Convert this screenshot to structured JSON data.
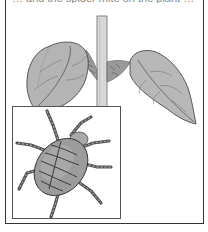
{
  "figure": {
    "caption_cropped": "… and the spider mite on the plant …",
    "colors": {
      "frame": "#333333",
      "leaf_fill": "#b8b8b8",
      "leaf_shadow": "#8a8a8a",
      "stem": "#d8d8d8",
      "mite_body": "#9a9a9a",
      "mite_stripes": "#444444",
      "background": "#ffffff"
    },
    "elements": {
      "stem": "plant-stem",
      "left_leaf": "left-leaf",
      "right_leaf": "right-leaf",
      "inset": "magnified-mite-inset",
      "mite": "spider-mite"
    }
  }
}
